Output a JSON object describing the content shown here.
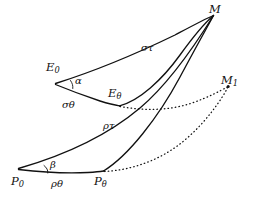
{
  "figure": {
    "type": "geometric-diagram",
    "background_color": "#ffffff",
    "ink_color": "#111111",
    "width": 259,
    "height": 203
  },
  "points": [
    {
      "id": "M",
      "label": "M",
      "sub": "",
      "x": 214,
      "y": 14
    },
    {
      "id": "M1",
      "label": "M",
      "sub": "1",
      "x": 228,
      "y": 86
    },
    {
      "id": "E0",
      "label": "E",
      "sub": "0",
      "x": 55,
      "y": 62
    },
    {
      "id": "Eth",
      "label": "E",
      "sub": "θ",
      "x": 117,
      "y": 92
    },
    {
      "id": "P0",
      "label": "P",
      "sub": "0",
      "x": 18,
      "y": 177
    },
    {
      "id": "Pth",
      "label": "P",
      "sub": "θ",
      "x": 101,
      "y": 177
    }
  ],
  "point_labels": {
    "M": "M",
    "M1_base": "M",
    "M1_sub": "1",
    "E0_base": "E",
    "E0_sub": "0",
    "Etheta_base": "E",
    "Etheta_sub": "θ",
    "P0_base": "P",
    "P0_sub": "0",
    "Ptheta_base": "P",
    "Ptheta_sub": "θ"
  },
  "arc_labels": {
    "sigma_tau": "στ",
    "sigma_theta": "σθ",
    "rho_tau": "ρτ",
    "rho_theta": "ρθ"
  },
  "angle_labels": {
    "alpha": "α",
    "beta": "β"
  },
  "curves": [
    {
      "name": "sigma-tau-arc",
      "from": "E0",
      "to": "M",
      "style": "solid",
      "label": "στ"
    },
    {
      "name": "sigma-theta-arc",
      "from": "E0",
      "to": "Eth",
      "style": "solid",
      "label": "σθ"
    },
    {
      "name": "e-theta-to-m",
      "from": "Eth",
      "to": "M",
      "style": "solid",
      "label": ""
    },
    {
      "name": "rho-tau-arc",
      "from": "P0",
      "to": "M",
      "style": "solid",
      "label": "ρτ"
    },
    {
      "name": "rho-theta-chord",
      "from": "P0",
      "to": "Pth",
      "style": "solid",
      "label": "ρθ"
    },
    {
      "name": "p-theta-to-m",
      "from": "Pth",
      "to": "M",
      "style": "solid",
      "label": ""
    },
    {
      "name": "e-theta-to-m1",
      "from": "Eth",
      "to": "M1",
      "style": "dotted",
      "label": ""
    },
    {
      "name": "p-theta-to-m1",
      "from": "Pth",
      "to": "M1",
      "style": "dotted",
      "label": ""
    }
  ]
}
